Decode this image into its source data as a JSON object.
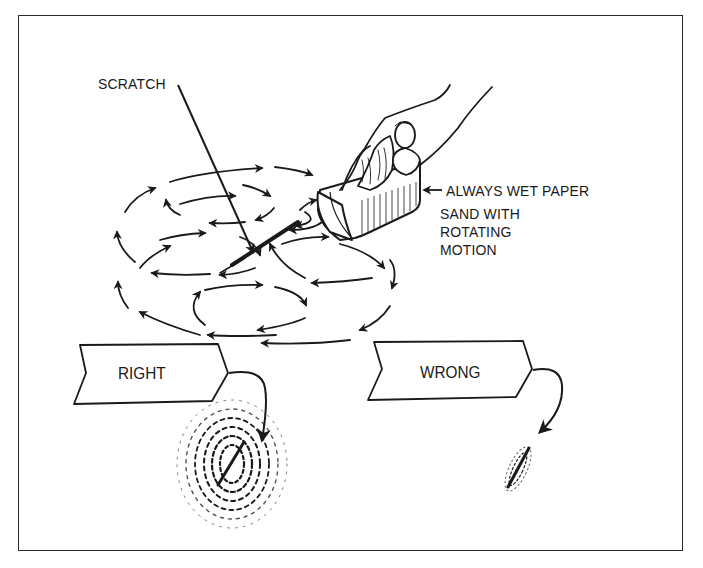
{
  "figure": {
    "labels": {
      "scratch": "SCRATCH",
      "wet_paper": "ALWAYS WET PAPER",
      "sand_instruction": [
        "SAND WITH",
        "ROTATING",
        "MOTION"
      ]
    },
    "examples": [
      {
        "label": "RIGHT",
        "result": "wide circular feathered sanding pattern around scratch"
      },
      {
        "label": "WRONG",
        "result": "narrow elongated sanding pattern along scratch"
      }
    ],
    "colors": {
      "ink": "#1a1a1a",
      "background": "#ffffff",
      "frame": "#2a2a2a"
    }
  }
}
